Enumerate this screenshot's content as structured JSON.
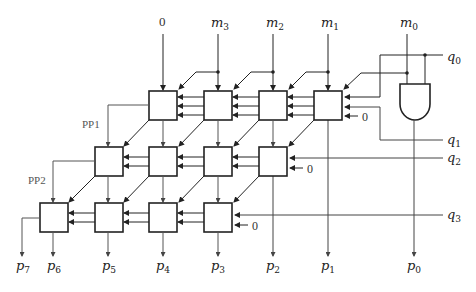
{
  "diagram": {
    "type": "array multiplier (4-bit, carry-save rows)",
    "inputs_top": [
      {
        "text": "0",
        "sub": ""
      },
      {
        "text": "m",
        "sub": "3"
      },
      {
        "text": "m",
        "sub": "2"
      },
      {
        "text": "m",
        "sub": "1"
      },
      {
        "text": "m",
        "sub": "0"
      }
    ],
    "inputs_right": [
      {
        "text": "q",
        "sub": "0"
      },
      {
        "text": "q",
        "sub": "1"
      },
      {
        "text": "q",
        "sub": "2"
      },
      {
        "text": "q",
        "sub": "3"
      }
    ],
    "outputs_bottom": [
      {
        "text": "p",
        "sub": "7"
      },
      {
        "text": "p",
        "sub": "6"
      },
      {
        "text": "p",
        "sub": "5"
      },
      {
        "text": "p",
        "sub": "4"
      },
      {
        "text": "p",
        "sub": "3"
      },
      {
        "text": "p",
        "sub": "2"
      },
      {
        "text": "p",
        "sub": "1"
      },
      {
        "text": "p",
        "sub": "0"
      }
    ],
    "partial_product_labels": [
      "PP1",
      "PP2"
    ],
    "carry_in_zero_label": "0",
    "rows": [
      {
        "name": "row-1",
        "cells": 4
      },
      {
        "name": "row-2",
        "cells": 4
      },
      {
        "name": "row-3",
        "cells": 4
      }
    ],
    "and_gate": {
      "label": "AND",
      "inputs": [
        "m0",
        "q0"
      ],
      "output": "p0"
    },
    "colors": {
      "line": "#222222",
      "thin_line": "#555555",
      "background": "#ffffff"
    }
  }
}
